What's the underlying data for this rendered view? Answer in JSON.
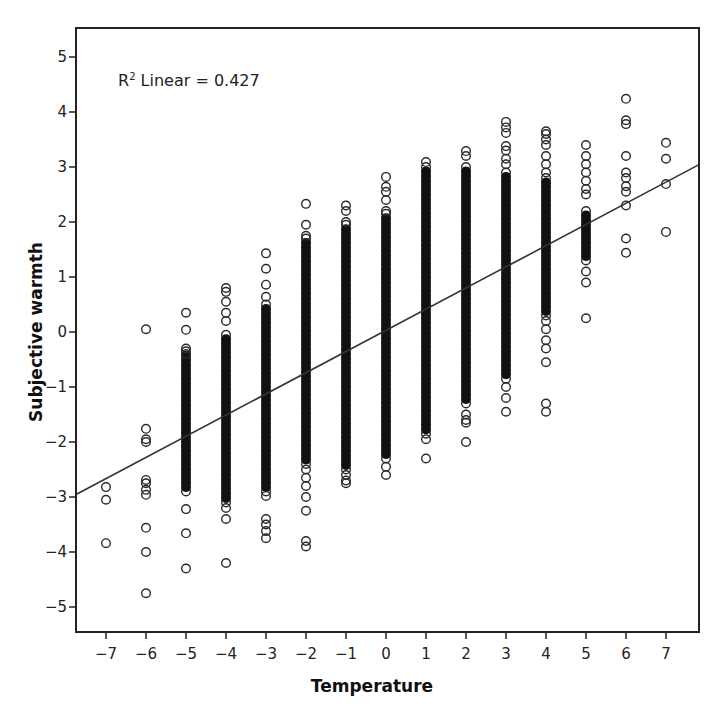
{
  "chart_data": {
    "type": "scatter",
    "title": "",
    "xlabel": "Temperature",
    "ylabel": "Subjective warmth",
    "xlim": [
      -7.75,
      7.85
    ],
    "ylim": [
      -5.45,
      5.5
    ],
    "xticks": [
      -7,
      -6,
      -5,
      -4,
      -3,
      -2,
      -1,
      0,
      1,
      2,
      3,
      4,
      5,
      6,
      7
    ],
    "xtick_labels": [
      "−7",
      "−6",
      "−5",
      "−4",
      "−3",
      "−2",
      "−1",
      "0",
      "1",
      "2",
      "3",
      "4",
      "5",
      "6",
      "7"
    ],
    "yticks": [
      5,
      4,
      3,
      2,
      1,
      0,
      -1,
      -2,
      -3,
      -4,
      -5
    ],
    "ytick_labels": [
      "5",
      "4",
      "3",
      "2",
      "1",
      "0",
      "−1",
      "−2",
      "−3",
      "−4",
      "−5"
    ],
    "grid": false,
    "legend": null,
    "annotation": {
      "text_prefix": "R",
      "superscript": "2",
      "text_suffix": " Linear = 0.427"
    },
    "fit_line": {
      "type": "linear",
      "r_squared": 0.427,
      "slope": 0.385,
      "intercept": 0.03
    },
    "columns": [
      {
        "x": -7,
        "dense": null,
        "points": [
          -2.82,
          -3.05,
          -3.84
        ]
      },
      {
        "x": -6,
        "dense": null,
        "points": [
          0.05,
          -1.76,
          -1.95,
          -2.0,
          -2.69,
          -2.75,
          -2.87,
          -2.96,
          -3.56,
          -4.0,
          -4.75
        ]
      },
      {
        "x": -5,
        "dense": [
          -2.9,
          -0.35
        ],
        "points": [
          0.35,
          0.04,
          -0.3,
          -0.4,
          -3.22,
          -3.66,
          -4.3
        ]
      },
      {
        "x": -4,
        "dense": [
          -3.1,
          -0.05
        ],
        "points": [
          0.8,
          0.73,
          0.55,
          0.35,
          0.2,
          -3.2,
          -3.4,
          -4.2
        ]
      },
      {
        "x": -3,
        "dense": [
          -2.9,
          0.5
        ],
        "points": [
          1.43,
          1.15,
          0.86,
          0.64,
          -2.98,
          -3.4,
          -3.5,
          -3.62,
          -3.75
        ]
      },
      {
        "x": -2,
        "dense": [
          -2.4,
          1.7
        ],
        "points": [
          2.33,
          1.95,
          1.75,
          -2.5,
          -2.65,
          -2.8,
          -3.0,
          -3.25,
          -3.8,
          -3.9
        ]
      },
      {
        "x": -1,
        "dense": [
          -2.5,
          1.95
        ],
        "points": [
          2.3,
          2.2,
          2.0,
          -2.6,
          -2.7,
          -2.75
        ]
      },
      {
        "x": 0,
        "dense": [
          -2.3,
          2.15
        ],
        "points": [
          2.82,
          2.64,
          2.55,
          2.4,
          2.2,
          -2.45,
          -2.6
        ]
      },
      {
        "x": 1,
        "dense": [
          -1.85,
          3.0
        ],
        "points": [
          3.09,
          -1.95,
          -2.3
        ]
      },
      {
        "x": 2,
        "dense": [
          -1.3,
          3.0
        ],
        "points": [
          3.29,
          3.2,
          -1.5,
          -1.6,
          -1.65,
          -2.0
        ]
      },
      {
        "x": 3,
        "dense": [
          -0.85,
          2.9
        ],
        "points": [
          3.82,
          3.72,
          3.62,
          3.38,
          3.3,
          3.15,
          3.05,
          -1.0,
          -1.2,
          -1.45
        ]
      },
      {
        "x": 4,
        "dense": [
          0.3,
          2.8
        ],
        "points": [
          3.65,
          3.6,
          3.5,
          3.4,
          3.2,
          3.05,
          2.9,
          0.2,
          0.05,
          -0.15,
          -0.3,
          -0.55,
          -1.3,
          -1.45
        ]
      },
      {
        "x": 5,
        "dense": [
          1.3,
          2.2
        ],
        "points": [
          3.4,
          3.2,
          3.05,
          2.9,
          2.75,
          2.6,
          2.5,
          1.1,
          0.9,
          0.25
        ]
      },
      {
        "x": 6,
        "dense": null,
        "points": [
          4.24,
          3.85,
          3.78,
          3.2,
          2.9,
          2.8,
          2.65,
          2.55,
          2.3,
          1.7,
          1.44
        ]
      },
      {
        "x": 7,
        "dense": null,
        "points": [
          3.44,
          3.15,
          2.69,
          1.82
        ]
      }
    ]
  }
}
